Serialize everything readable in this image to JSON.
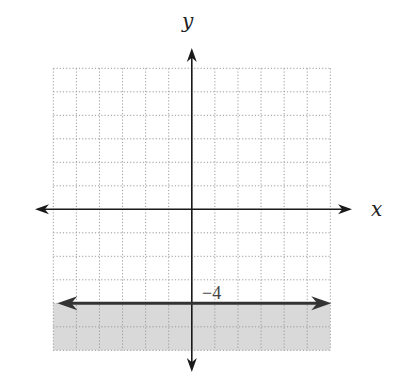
{
  "chart_data": {
    "type": "line",
    "title": "",
    "xlabel": "x",
    "ylabel": "y",
    "xlim": [
      -6,
      6
    ],
    "ylim": [
      -6,
      6
    ],
    "grid": true,
    "grid_step": 1,
    "grid_style": "dotted",
    "series": [
      {
        "name": "boundary",
        "kind": "horizontal-line",
        "y": -4,
        "x": [
          -6,
          6
        ],
        "line_style": "solid",
        "arrows": "both"
      }
    ],
    "shaded_region": {
      "y_from": -6,
      "y_to": -4,
      "color": "#d9d9d9"
    },
    "annotations": [
      {
        "text": "−4",
        "x": 1,
        "y": -4,
        "position": "above-right"
      }
    ],
    "inequality": "y ≤ -4"
  },
  "labels": {
    "x_axis": "x",
    "y_axis": "y",
    "boundary_value": "−4"
  },
  "colors": {
    "axis": "#1a1a1a",
    "boundary": "#333333",
    "grid": "#9a9a9a",
    "shade": "#d9d9d9"
  }
}
